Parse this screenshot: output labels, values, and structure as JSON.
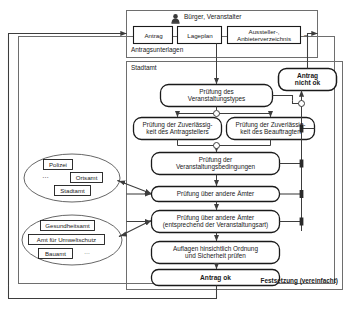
{
  "diagram": {
    "type": "process-flow",
    "language": "de",
    "actor_row": {
      "icon": "person-icon",
      "label": "Bürger, Veranstalter",
      "group_caption": "Antragsunterlagen",
      "documents": [
        {
          "label": "Antrag"
        },
        {
          "label": "Lageplan"
        },
        {
          "label": "Aussteller-,\nAnbieterverzeichnis"
        }
      ],
      "ellipsis": "–"
    },
    "authority_frame": {
      "caption": "Stadtamt",
      "footer_caption": "Festsetzung (vereinfacht)"
    },
    "functions": [
      {
        "id": "f1",
        "label": "Prüfung des\nVeranstaltungstypes",
        "bold": false
      },
      {
        "id": "f2",
        "label": "Prüfung der Zuverlässig-\nkeit des Antragstellers",
        "bold": false
      },
      {
        "id": "f3",
        "label": "Prüfung der Zuverlässig-\nkeit des Beauftragten",
        "bold": false
      },
      {
        "id": "f4",
        "label": "Prüfung der\nVeranstaltungsbedingungen",
        "bold": false
      },
      {
        "id": "f5",
        "label": "Prüfung über andere Ämter",
        "bold": false
      },
      {
        "id": "f6",
        "label": "Prüfung über andere Ämter\n(entsprechend der Veranstaltungsart)",
        "bold": false
      },
      {
        "id": "f7",
        "label": "Auflagen hinsichtlich Ordnung\nund Sicherheit prüfen",
        "bold": false
      },
      {
        "id": "f8",
        "label": "Antrag ok",
        "bold": true
      },
      {
        "id": "f9",
        "label": "Antrag\nnicht ok",
        "bold": true
      }
    ],
    "org_groups": [
      {
        "id": "g1",
        "items": [
          "Polizei",
          "Ortsamt",
          "Stadtamt"
        ],
        "ellipsis": "…"
      },
      {
        "id": "g2",
        "items": [
          "Gesundheitsamt",
          "Amt für Umweltschutz",
          "Bauamt"
        ],
        "ellipsis": "…"
      }
    ],
    "connector_legend": {
      "and_junction": "open-circle",
      "merge_marker": "filled-bar"
    },
    "colors": {
      "stroke": "#1a1a1a",
      "frame_stroke": "#555555",
      "arrow": "#444444",
      "background": "#ffffff",
      "text": "#1a1a1a"
    }
  }
}
